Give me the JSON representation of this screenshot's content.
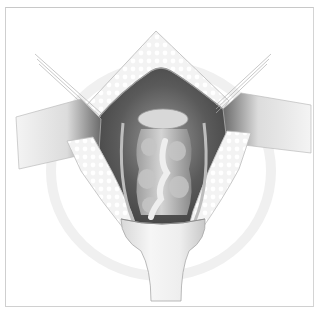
{
  "figure": {
    "type": "surgical-illustration",
    "style": "grayscale",
    "caption": "",
    "colors": {
      "background": "#ffffff",
      "frame": "#cccccc",
      "cavity_dark": "#4a4a4a",
      "tissue_mid": "#8c8c8c",
      "tissue_light": "#d9d9d9",
      "skin_flap": "#f2f2f2",
      "retractor": "#e6e6e6"
    },
    "elements": [
      "upper-skin-flap",
      "left-retractor-blade",
      "right-retractor-blade",
      "left-lower-skin-flap",
      "right-lower-skin-flap",
      "exposed-cavity",
      "central-tissue-structure",
      "bottom-retractor-handle",
      "stay-sutures"
    ]
  }
}
